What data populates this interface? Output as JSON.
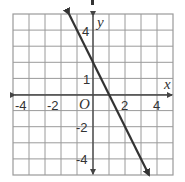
{
  "chart_data": {
    "type": "line",
    "title": "",
    "xlabel": "x",
    "ylabel": "y",
    "origin_label": "O",
    "xlim": [
      -5,
      5
    ],
    "ylim": [
      -5,
      5
    ],
    "grid": true,
    "x_ticks": [
      "-4",
      "-2",
      "2",
      "4"
    ],
    "y_ticks": [
      "4",
      "1",
      "-2",
      "-4"
    ],
    "series": [
      {
        "name": "line",
        "equation": "y = -2x + 2",
        "x": [
          -1.5,
          3.5
        ],
        "y": [
          5,
          -5
        ],
        "arrows": "both"
      }
    ],
    "colors": {
      "grid": "#9a9a9a",
      "axis": "#444444",
      "line": "#333333"
    }
  }
}
